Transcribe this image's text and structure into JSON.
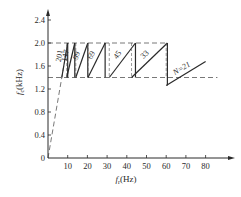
{
  "chart_data": {
    "type": "line",
    "title": "",
    "xlabel": "f_r (Hz)",
    "ylabel": "f_c (kHz)",
    "xlim": [
      0,
      90
    ],
    "ylim": [
      0,
      2.5
    ],
    "x_ticks": [
      10,
      20,
      30,
      40,
      50,
      60,
      70,
      80
    ],
    "y_ticks": [
      0,
      0.4,
      0.8,
      1.2,
      1.6,
      2.0,
      2.4
    ],
    "y_tick_labels": [
      "0",
      "0.4",
      "0.8",
      "1.2",
      "1.6",
      "2.0",
      "2.4"
    ],
    "x_tick_labels": [
      "10",
      "20",
      "30",
      "40",
      "50",
      "60",
      "70",
      "80"
    ],
    "grid": false,
    "reference_lines": [
      {
        "type": "horizontal",
        "y": 2.0,
        "style": "dashed",
        "x_range": [
          0,
          60
        ]
      },
      {
        "type": "horizontal",
        "y": 1.4,
        "style": "dashed",
        "x_range": [
          0,
          86
        ]
      },
      {
        "type": "ray",
        "style": "dashed",
        "from": [
          0,
          0
        ],
        "to": [
          10,
          2.0
        ],
        "note": "fc = N_max * fr asymptote"
      }
    ],
    "series": [
      {
        "name": "N=201",
        "label": "201",
        "x": [
          7.0,
          10.0
        ],
        "y": [
          1.4,
          2.0
        ]
      },
      {
        "name": "N=147",
        "label": "147",
        "x": [
          9.5,
          13.6
        ],
        "y": [
          1.4,
          2.0
        ]
      },
      {
        "name": "N=99",
        "label": "99",
        "x": [
          14.1,
          20.2
        ],
        "y": [
          1.4,
          2.0
        ]
      },
      {
        "name": "N=69",
        "label": "69",
        "x": [
          20.3,
          29.0
        ],
        "y": [
          1.4,
          2.0
        ]
      },
      {
        "name": "N=45",
        "label": "45",
        "x": [
          31.1,
          44.4
        ],
        "y": [
          1.4,
          2.0
        ]
      },
      {
        "name": "N=33",
        "label": "33",
        "x": [
          42.4,
          60.6
        ],
        "y": [
          1.4,
          2.0
        ]
      },
      {
        "name": "N=21",
        "label": "N=21",
        "x": [
          60.0,
          80.0
        ],
        "y": [
          1.26,
          1.68
        ]
      }
    ],
    "annotations": [
      "201",
      "147",
      "99",
      "69",
      "45",
      "33",
      "N=21"
    ]
  },
  "axes": {
    "y_label_main": "f",
    "y_label_sub": "c",
    "y_label_unit": "(kHz)",
    "x_label_main": "f",
    "x_label_sub": "r",
    "x_label_unit": "(Hz)"
  }
}
